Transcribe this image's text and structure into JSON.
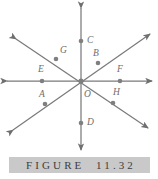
{
  "figure": {
    "caption": "FIGURE  11.32",
    "caption_band_color": "#c9c9c9",
    "caption_text_color": "#3d3d3d",
    "background_color": "#ffffff",
    "line_color": "#7a7a7a",
    "point_color": "#7f7f7f",
    "label_color": "#6e6e6e"
  },
  "diagram": {
    "type": "four-concurrent-lines",
    "center": {
      "name": "O",
      "x": 81,
      "y": 81
    },
    "lines": [
      {
        "name": "horizontal-line",
        "x1": 7,
        "y1": 81,
        "x2": 152,
        "y2": 81,
        "arrows": "both"
      },
      {
        "name": "vertical-line",
        "x1": 81,
        "y1": 8,
        "x2": 81,
        "y2": 150,
        "arrows": "both"
      },
      {
        "name": "diagonal-line-nw-se",
        "x1": 16,
        "y1": 39,
        "x2": 148,
        "y2": 128,
        "arrows": "both"
      },
      {
        "name": "diagonal-line-sw-ne",
        "x1": 13,
        "y1": 130,
        "x2": 150,
        "y2": 34,
        "arrows": "both"
      }
    ],
    "points": [
      {
        "label": "A",
        "x": 45,
        "y": 104,
        "label_dx": -6,
        "label_dy": -14
      },
      {
        "label": "B",
        "x": 98,
        "y": 63,
        "label_dx": -5,
        "label_dy": -14
      },
      {
        "label": "C",
        "x": 81,
        "y": 41,
        "label_dx": 6,
        "label_dy": -5
      },
      {
        "label": "D",
        "x": 81,
        "y": 123,
        "label_dx": 6,
        "label_dy": -5
      },
      {
        "label": "E",
        "x": 42,
        "y": 81,
        "label_dx": -4,
        "label_dy": -16
      },
      {
        "label": "F",
        "x": 120,
        "y": 81,
        "label_dx": -3,
        "label_dy": -16
      },
      {
        "label": "G",
        "x": 56,
        "y": 59,
        "label_dx": 4,
        "label_dy": -13
      },
      {
        "label": "H",
        "x": 113,
        "y": 103,
        "label_dx": 0,
        "label_dy": -15
      },
      {
        "label": "O",
        "x": 81,
        "y": 81,
        "label_dx": 3,
        "label_dy": 9
      }
    ]
  }
}
